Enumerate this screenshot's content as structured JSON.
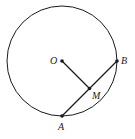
{
  "diagram": {
    "type": "geometry",
    "circle": {
      "center": "O",
      "cx": 62,
      "cy": 61,
      "r": 55
    },
    "points": [
      {
        "id": "O",
        "label": "O",
        "x": 62,
        "y": 61
      },
      {
        "id": "B",
        "label": "B",
        "x": 117,
        "y": 61
      },
      {
        "id": "A",
        "label": "A",
        "x": 62,
        "y": 116
      },
      {
        "id": "M",
        "label": "M",
        "x": 89.5,
        "y": 88.5
      }
    ],
    "segments": [
      {
        "from": "O",
        "to": "M"
      },
      {
        "from": "A",
        "to": "B"
      }
    ],
    "colors": {
      "stroke": "#1a1a1a",
      "background": "#ffffff"
    }
  }
}
